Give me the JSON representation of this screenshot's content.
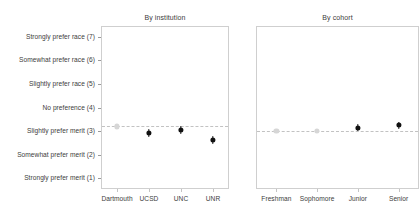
{
  "figure": {
    "width": 420,
    "height": 220,
    "background": "#ffffff",
    "point_color": "#111111",
    "muted_point_color": "#d6d6d6",
    "refline_color": "#c2c2c2",
    "panel_border_color": "#cfcfcf"
  },
  "chart_data": {
    "type": "scatter",
    "title": "",
    "xlabel": "",
    "ylabel": "",
    "ylim": [
      0.55,
      7.45
    ],
    "grid": false,
    "legend": null,
    "y_tick_values": [
      1,
      2,
      3,
      4,
      5,
      6,
      7
    ],
    "y_tick_labels": [
      "Strongly prefer merit (1)",
      "Somewhat prefer merit (2)",
      "Slightly prefer merit (3)",
      "No preference (4)",
      "Slightly prefer race (5)",
      "Somewhat prefer race (6)",
      "Strongly prefer race (7)"
    ],
    "panels": [
      {
        "title": "By institution",
        "categories": [
          "Dartmouth",
          "UCSD",
          "UNC",
          "UNR"
        ],
        "reference_line": 3.2,
        "values": [
          3.2,
          2.92,
          3.05,
          2.62
        ],
        "ci_low": [
          3.2,
          2.74,
          2.87,
          2.46
        ],
        "ci_high": [
          3.2,
          3.1,
          3.23,
          2.78
        ],
        "muted": [
          true,
          false,
          false,
          false
        ]
      },
      {
        "title": "By cohort",
        "categories": [
          "Freshman",
          "Sophomore",
          "Junior",
          "Senior"
        ],
        "reference_line": 3.0,
        "values": [
          3.0,
          3.02,
          3.14,
          3.25
        ],
        "ci_low": [
          2.94,
          2.94,
          2.99,
          3.11
        ],
        "ci_high": [
          3.06,
          3.1,
          3.29,
          3.39
        ],
        "muted": [
          true,
          true,
          false,
          false
        ]
      }
    ]
  }
}
